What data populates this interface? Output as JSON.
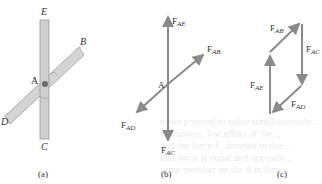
{
  "figure": {
    "panels": [
      {
        "id": "a",
        "caption": "(a)",
        "labels": {
          "E": "E",
          "B": "B",
          "A": "A",
          "D": "D",
          "C": "C"
        },
        "description": "Two rods crossing at joint A: vertical rod EC and inclined rod DB"
      },
      {
        "id": "b",
        "caption": "(b)",
        "joint_label": "A",
        "forces": [
          {
            "name": "F",
            "sub": "AE",
            "direction": "up"
          },
          {
            "name": "F",
            "sub": "AB",
            "direction": "up-right"
          },
          {
            "name": "F",
            "sub": "AD",
            "direction": "down-left"
          },
          {
            "name": "F",
            "sub": "AC",
            "direction": "down"
          }
        ]
      },
      {
        "id": "c",
        "caption": "(c)",
        "description": "Force polygon (parallelogram) of the four forces",
        "forces": [
          {
            "name": "F",
            "sub": "AB"
          },
          {
            "name": "F",
            "sub": "AC"
          },
          {
            "name": "F",
            "sub": "AE"
          },
          {
            "name": "F",
            "sub": "AD"
          }
        ]
      }
    ],
    "colors": {
      "rod_fill": "#d4d4d4",
      "rod_stroke": "#9a9a9a",
      "arrow": "#8a8a8a",
      "label": "#333333"
    }
  }
}
